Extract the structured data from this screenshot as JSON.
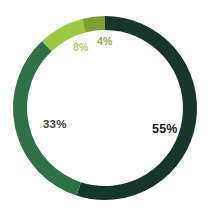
{
  "chart_data": {
    "type": "pie",
    "variant": "donut",
    "title": "",
    "subtitle": "",
    "xlabel": "",
    "ylabel": "",
    "legend": "none",
    "grid": false,
    "total": 100,
    "units": "%",
    "categories": [
      "55%",
      "33%",
      "8%",
      "4%"
    ],
    "values": [
      55,
      33,
      8,
      4
    ],
    "labels": [
      "55%",
      "33%",
      "8%",
      "4%"
    ],
    "colors": [
      "#18352b",
      "#2f7049",
      "#9cc93f",
      "#7d9f33"
    ],
    "slices": [
      {
        "label": "55%",
        "value": 55,
        "color": "#18352b",
        "label_color": "#17201c",
        "start_angle_deg": 0,
        "end_angle_deg": 198
      },
      {
        "label": "33%",
        "value": 33,
        "color": "#2f7049",
        "label_color": "#3b433e",
        "start_angle_deg": 198,
        "end_angle_deg": 316.8
      },
      {
        "label": "8%",
        "value": 8,
        "color": "#9cc93f",
        "label_color": "#b4cf6a",
        "start_angle_deg": 316.8,
        "end_angle_deg": 345.6
      },
      {
        "label": "4%",
        "value": 4,
        "color": "#7d9f33",
        "label_color": "#95ad57",
        "start_angle_deg": 345.6,
        "end_angle_deg": 360
      }
    ],
    "geometry": {
      "center_x": 105,
      "center_y": 108,
      "outer_radius": 92,
      "ring_thickness": 14
    },
    "background": "#ffffff"
  }
}
